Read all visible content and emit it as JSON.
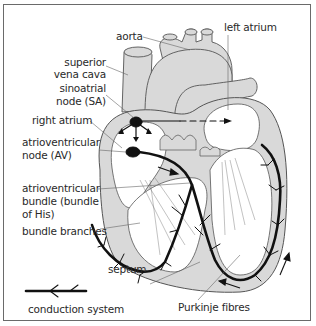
{
  "diagram": {
    "colors": {
      "tissue_fill": "#d9d9d9",
      "outline": "#555555",
      "conduction": "#111111",
      "background": "#ffffff",
      "frame": "#6a6a6a",
      "label_text": "#2a2a2a"
    },
    "labels": {
      "aorta": "aorta",
      "left_atrium": "left atrium",
      "superior_vena_cava_1": "superior",
      "superior_vena_cava_2": "vena cava",
      "sinoatrial_node_1": "sinoatrial",
      "sinoatrial_node_2": "node (SA)",
      "right_atrium": "right atrium",
      "av_node_1": "atrioventricular",
      "av_node_2": "node (AV)",
      "av_bundle_1": "atrioventricular",
      "av_bundle_2": "bundle (bundle",
      "av_bundle_3": "of His)",
      "bundle_branches": "bundle branches",
      "septum": "septum",
      "purkinje_fibres": "Purkinje fibres"
    },
    "legend": {
      "symbol": "conduction-line",
      "label": "conduction system"
    }
  }
}
